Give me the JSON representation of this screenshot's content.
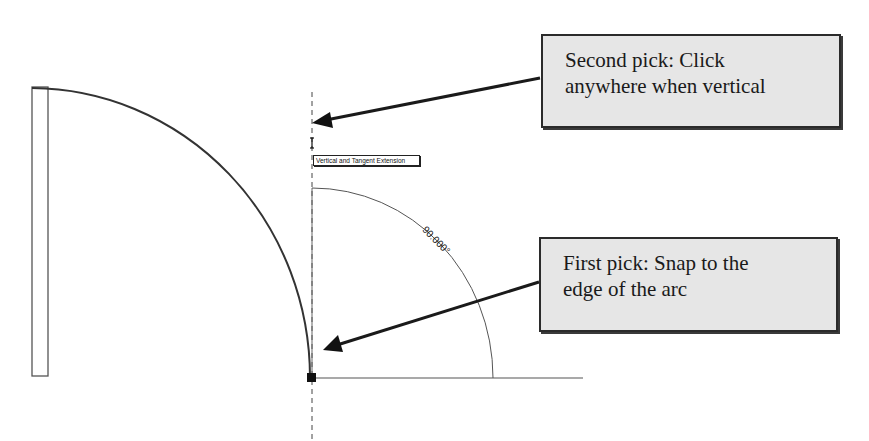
{
  "callouts": {
    "second_pick": {
      "line1": "Second pick: Click",
      "line2": "anywhere when vertical"
    },
    "first_pick": {
      "line1": "First pick: Snap to the",
      "line2": "edge of the arc"
    }
  },
  "drawing": {
    "snap_tooltip": "Vertical and Tangent Extension",
    "angle_dimension": "90.000°",
    "colors": {
      "callout_fill": "#e6e6e6",
      "callout_border": "#2b2b2b",
      "line": "#333333",
      "background": "#ffffff"
    }
  }
}
